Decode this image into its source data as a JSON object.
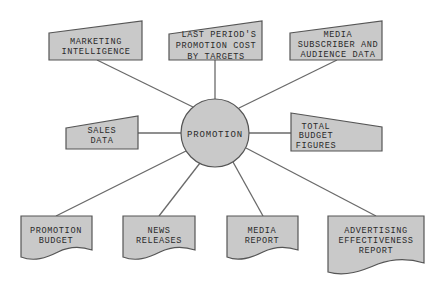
{
  "diagram": {
    "type": "hub-and-spoke",
    "hub": {
      "label": "PROMOTION",
      "shape": "circle"
    },
    "inputs": [
      {
        "id": "marketing-intelligence",
        "lines": [
          "MARKETING",
          "INTELLIGENCE"
        ],
        "shape": "manual-input"
      },
      {
        "id": "last-period-cost",
        "lines": [
          "LAST PERIOD'S",
          "PROMOTION COST",
          "BY TARGETS"
        ],
        "shape": "manual-input"
      },
      {
        "id": "media-subscriber",
        "lines": [
          "MEDIA",
          "SUBSCRIBER AND",
          "AUDIENCE DATA"
        ],
        "shape": "manual-input"
      },
      {
        "id": "sales-data",
        "lines": [
          "SALES",
          "DATA"
        ],
        "shape": "manual-input"
      },
      {
        "id": "total-budget",
        "lines": [
          "TOTAL",
          "BUDGET",
          "FIGURES"
        ],
        "shape": "manual-input"
      }
    ],
    "outputs": [
      {
        "id": "promotion-budget",
        "lines": [
          "PROMOTION",
          "BUDGET"
        ],
        "shape": "document"
      },
      {
        "id": "news-releases",
        "lines": [
          "NEWS",
          "RELEASES"
        ],
        "shape": "document"
      },
      {
        "id": "media-report",
        "lines": [
          "MEDIA",
          "REPORT"
        ],
        "shape": "document"
      },
      {
        "id": "advertising-effectiveness",
        "lines": [
          "ADVERTISING",
          "EFFECTIVENESS",
          "REPORT"
        ],
        "shape": "document"
      }
    ]
  },
  "colors": {
    "fill": "#c9c9c9",
    "stroke": "#555555",
    "edge": "#6a6a6a",
    "text": "#2a2a2a"
  }
}
